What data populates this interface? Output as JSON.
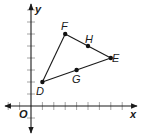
{
  "figure": {
    "type": "coordinate-plane",
    "axes": {
      "x_label": "x",
      "y_label": "y",
      "origin_label": "O",
      "x_range": [
        -2,
        9
      ],
      "y_range": [
        -2,
        8
      ],
      "tick_step": 1
    },
    "points": [
      {
        "name": "D",
        "x": 1,
        "y": 2
      },
      {
        "name": "F",
        "x": 3,
        "y": 6
      },
      {
        "name": "E",
        "x": 7,
        "y": 4
      },
      {
        "name": "H",
        "x": 5,
        "y": 5
      },
      {
        "name": "G",
        "x": 4,
        "y": 3
      }
    ],
    "segments": [
      [
        "D",
        "F"
      ],
      [
        "F",
        "E"
      ],
      [
        "E",
        "D"
      ]
    ],
    "colors": {
      "line": "#1a1a1a",
      "tick": "#9a9a9a",
      "point": "#111111"
    }
  },
  "labels": {
    "D": "D",
    "F": "F",
    "E": "E",
    "H": "H",
    "G": "G",
    "x": "x",
    "y": "y",
    "O": "O"
  }
}
